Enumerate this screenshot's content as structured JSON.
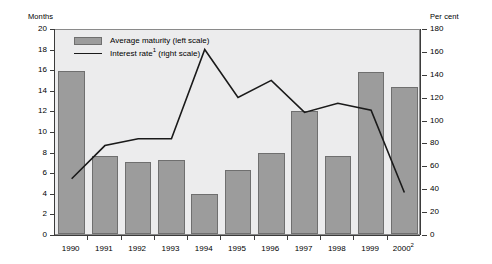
{
  "chart_data": {
    "type": "bar",
    "title": "",
    "subtitle": "",
    "categories": [
      "1990",
      "1991",
      "1992",
      "1993",
      "1994",
      "1995",
      "1996",
      "1997",
      "1998",
      "1999",
      "2000"
    ],
    "category_labels": [
      "1990",
      "1991",
      "1992",
      "1993",
      "1994",
      "1995",
      "1996",
      "1997",
      "1998",
      "1999",
      "2000"
    ],
    "category_superscripts": [
      "",
      "",
      "",
      "",
      "",
      "",
      "",
      "",
      "",
      "",
      "2"
    ],
    "series": [
      {
        "name": "Average maturity (left scale)",
        "type": "bar",
        "axis": "left",
        "unit": "Months",
        "values": [
          15.8,
          7.6,
          7.0,
          7.2,
          3.9,
          6.2,
          7.9,
          11.9,
          7.6,
          15.7,
          14.3
        ]
      },
      {
        "name": "Interest rate (right scale)",
        "type": "line",
        "axis": "right",
        "unit": "Per cent",
        "values": [
          50,
          79,
          85,
          85,
          163,
          121,
          136,
          108,
          116,
          110,
          38
        ]
      }
    ],
    "xlabel": "",
    "ylabel": "Months",
    "y2label": "Per cent",
    "ylim": [
      0,
      20
    ],
    "y2lim": [
      0,
      180
    ],
    "yticks": [
      0,
      2,
      4,
      6,
      8,
      10,
      12,
      14,
      16,
      18,
      20
    ],
    "y2ticks": [
      0,
      20,
      40,
      60,
      80,
      100,
      120,
      140,
      160,
      180
    ],
    "grid": false,
    "legend_position": "top-left",
    "colors": {
      "bar_fill": "#9c9c9c",
      "bar_stroke": "#6f6f6f",
      "line": "#1a1a1a",
      "plot_background": "#ececed",
      "axis": "#3b3b3b"
    }
  },
  "axes": {
    "left_unit": "Months",
    "right_unit": "Per cent"
  },
  "legend": {
    "items": [
      {
        "label": "Average maturity (left scale)",
        "swatch": "bar-swatch",
        "footnote": ""
      },
      {
        "label": "Interest rate",
        "label_suffix": " (right scale)",
        "swatch": "line-swatch",
        "footnote": "1"
      }
    ]
  }
}
